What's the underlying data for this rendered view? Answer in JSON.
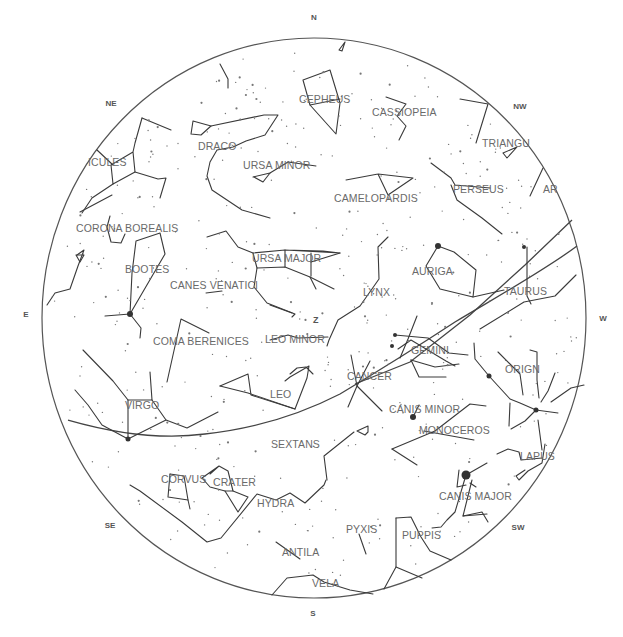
{
  "chart_title": "Sky chart",
  "horizon": {
    "cx": 314,
    "cy": 318,
    "rx": 272,
    "ry": 280
  },
  "zenith": {
    "label": "Z",
    "x": 313,
    "y": 323
  },
  "directions": [
    {
      "label": "N",
      "x": 314,
      "y": 20
    },
    {
      "label": "NE",
      "x": 111,
      "y": 106
    },
    {
      "label": "E",
      "x": 26,
      "y": 317
    },
    {
      "label": "SE",
      "x": 110,
      "y": 528
    },
    {
      "label": "S",
      "x": 313,
      "y": 616
    },
    {
      "label": "SW",
      "x": 518,
      "y": 530
    },
    {
      "label": "W",
      "x": 603,
      "y": 321
    },
    {
      "label": "NW",
      "x": 520,
      "y": 109
    }
  ],
  "constellations": [
    {
      "name": "CEPHEUS",
      "x": 299,
      "y": 103
    },
    {
      "name": "CASSIOPEIA",
      "x": 372,
      "y": 116
    },
    {
      "name": "TRIANGULUM",
      "x": 482,
      "y": 147,
      "display": "TRIANGU"
    },
    {
      "name": "DRACO",
      "x": 198,
      "y": 150
    },
    {
      "name": "URSA MINOR",
      "x": 243,
      "y": 169
    },
    {
      "name": "HERCULES",
      "x": 88,
      "y": 166,
      "display": "ICULES"
    },
    {
      "name": "PERSEUS",
      "x": 453,
      "y": 193
    },
    {
      "name": "ARIES",
      "x": 543,
      "y": 193,
      "display": "AR"
    },
    {
      "name": "CAMELOPARDIS",
      "x": 334,
      "y": 202
    },
    {
      "name": "CORONA BOREALIS",
      "x": 76,
      "y": 232
    },
    {
      "name": "URSA MAJOR",
      "x": 252,
      "y": 262
    },
    {
      "name": "AURIGA",
      "x": 412,
      "y": 275
    },
    {
      "name": "BOOTES",
      "x": 125,
      "y": 273
    },
    {
      "name": "CANES VENATICI",
      "x": 170,
      "y": 289
    },
    {
      "name": "TAURUS",
      "x": 504,
      "y": 295
    },
    {
      "name": "LYNX",
      "x": 363,
      "y": 296
    },
    {
      "name": "COMA BERENICES",
      "x": 153,
      "y": 345
    },
    {
      "name": "LEO MINOR",
      "x": 265,
      "y": 343
    },
    {
      "name": "GEMINI",
      "x": 411,
      "y": 354
    },
    {
      "name": "ORION",
      "x": 505,
      "y": 373,
      "display": "ORIGN"
    },
    {
      "name": "CANCER",
      "x": 347,
      "y": 380
    },
    {
      "name": "LEO",
      "x": 270,
      "y": 398
    },
    {
      "name": "VIRGO",
      "x": 125,
      "y": 409
    },
    {
      "name": "CANIS MINOR",
      "x": 389,
      "y": 413
    },
    {
      "name": "MONOCEROS",
      "x": 419,
      "y": 434
    },
    {
      "name": "SEXTANS",
      "x": 271,
      "y": 448
    },
    {
      "name": "LEPUS",
      "x": 520,
      "y": 460,
      "display": "LAPUS"
    },
    {
      "name": "CORVUS",
      "x": 161,
      "y": 483
    },
    {
      "name": "CRATER",
      "x": 213,
      "y": 486
    },
    {
      "name": "CANIS MAJOR",
      "x": 439,
      "y": 500
    },
    {
      "name": "HYDRA",
      "x": 257,
      "y": 507
    },
    {
      "name": "PYXIS",
      "x": 346,
      "y": 533
    },
    {
      "name": "PUPPIS",
      "x": 402,
      "y": 539
    },
    {
      "name": "ANTILA",
      "x": 282,
      "y": 556
    },
    {
      "name": "VELA",
      "x": 312,
      "y": 587
    }
  ],
  "bright_stars": [
    {
      "x": 438,
      "y": 246,
      "r": 3
    },
    {
      "x": 130,
      "y": 314,
      "r": 3
    },
    {
      "x": 489,
      "y": 376,
      "r": 2.5
    },
    {
      "x": 536,
      "y": 410,
      "r": 2.5
    },
    {
      "x": 413,
      "y": 417,
      "r": 3
    },
    {
      "x": 466,
      "y": 475,
      "r": 4.5
    },
    {
      "x": 128,
      "y": 439,
      "r": 2.5
    },
    {
      "x": 395,
      "y": 335,
      "r": 2
    },
    {
      "x": 392,
      "y": 346,
      "r": 2
    },
    {
      "x": 524,
      "y": 247,
      "r": 2
    }
  ]
}
